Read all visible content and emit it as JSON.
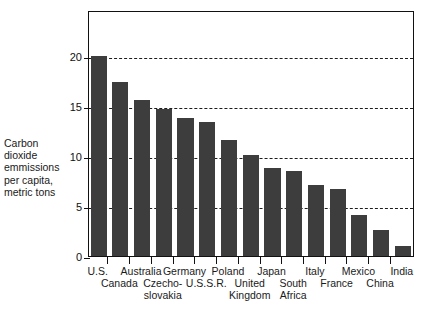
{
  "chart_data": {
    "type": "bar",
    "title": "",
    "subtitle": "",
    "xlabel": "",
    "ylabel": "Carbon dioxide emmissions per capita, metric tons",
    "ylabel_lines": [
      "Carbon",
      "dioxide",
      "emmissions",
      "per capita,",
      "metric tons"
    ],
    "categories": [
      "U.S.",
      "Canada",
      "Australia",
      "Czecho-slovakia",
      "Germany",
      "U.S.S.R.",
      "Poland",
      "United Kingdom",
      "Japan",
      "South Africa",
      "Italy",
      "France",
      "Mexico",
      "China",
      "India"
    ],
    "category_label_lines": [
      [
        "U.S."
      ],
      [
        "Canada"
      ],
      [
        "Australia"
      ],
      [
        "Czecho-",
        "slovakia"
      ],
      [
        "Germany"
      ],
      [
        "U.S.S.R."
      ],
      [
        "Poland"
      ],
      [
        "United",
        "Kingdom"
      ],
      [
        "Japan"
      ],
      [
        "South",
        "Africa"
      ],
      [
        "Italy"
      ],
      [
        "France"
      ],
      [
        "Mexico"
      ],
      [
        "China"
      ],
      [
        "India"
      ]
    ],
    "values": [
      20.0,
      17.4,
      15.6,
      14.7,
      13.8,
      13.4,
      11.6,
      10.1,
      8.8,
      8.5,
      7.1,
      6.7,
      4.1,
      2.6,
      1.0
    ],
    "ylim": [
      0,
      24.6
    ],
    "yticks": [
      0,
      5,
      10,
      15,
      20
    ],
    "ytick_labels": [
      "0",
      "5",
      "10",
      "15",
      "20"
    ],
    "gridlines": [
      5,
      10,
      15,
      20
    ],
    "grid": true,
    "grid_style": "dashed",
    "legend": null,
    "legend_position": "none",
    "bar_color": "#3d3d3d",
    "axis_color": "#111111",
    "background_color": "#ffffff"
  }
}
